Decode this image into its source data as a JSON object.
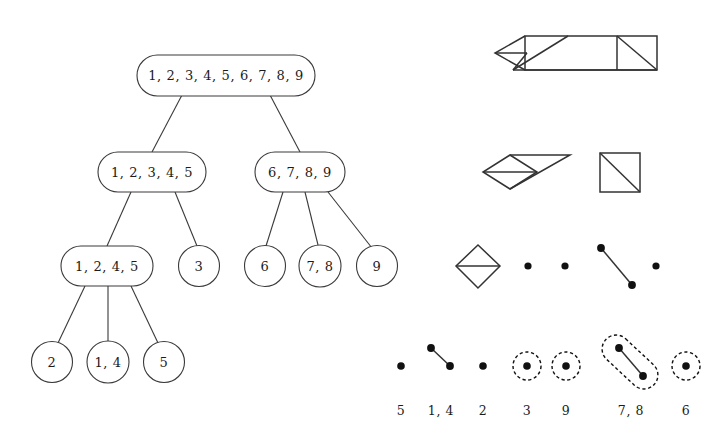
{
  "figure": {
    "background_color": "#ffffff",
    "stroke_color": "#3a3a3a",
    "dot_color": "#111111"
  },
  "tree": {
    "levels": [
      {
        "level": 0,
        "nodes": [
          {
            "id": "root",
            "label": "1, 2, 3, 4, 5, 6, 7, 8, 9",
            "shape": "stadium",
            "cx": 226,
            "cy": 75,
            "w": 178,
            "h": 41
          }
        ]
      },
      {
        "level": 1,
        "nodes": [
          {
            "id": "n-12345",
            "label": "1, 2, 3, 4, 5",
            "shape": "stadium",
            "cx": 152,
            "cy": 172,
            "w": 108,
            "h": 40
          },
          {
            "id": "n-6789",
            "label": "6, 7, 8, 9",
            "shape": "stadium",
            "cx": 300,
            "cy": 172,
            "w": 90,
            "h": 40
          }
        ]
      },
      {
        "level": 2,
        "nodes": [
          {
            "id": "n-1245",
            "label": "1, 2, 4, 5",
            "shape": "stadium",
            "cx": 107,
            "cy": 266,
            "w": 92,
            "h": 40
          },
          {
            "id": "n-3",
            "label": "3",
            "shape": "circle",
            "cx": 199,
            "cy": 266,
            "w": 40,
            "h": 40
          },
          {
            "id": "n-6",
            "label": "6",
            "shape": "circle",
            "cx": 265,
            "cy": 266,
            "w": 40,
            "h": 40
          },
          {
            "id": "n-78",
            "label": "7, 8",
            "shape": "circle",
            "cx": 320,
            "cy": 266,
            "w": 42,
            "h": 42
          },
          {
            "id": "n-9",
            "label": "9",
            "shape": "circle",
            "cx": 377,
            "cy": 266,
            "w": 40,
            "h": 40
          }
        ]
      },
      {
        "level": 3,
        "nodes": [
          {
            "id": "n-2",
            "label": "2",
            "shape": "circle",
            "cx": 52,
            "cy": 362,
            "w": 40,
            "h": 40
          },
          {
            "id": "n-14",
            "label": "1, 4",
            "shape": "circle",
            "cx": 108,
            "cy": 362,
            "w": 42,
            "h": 42
          },
          {
            "id": "n-5",
            "label": "5",
            "shape": "circle",
            "cx": 164,
            "cy": 362,
            "w": 40,
            "h": 40
          }
        ]
      }
    ],
    "edges": [
      {
        "from": "root",
        "to": "n-12345"
      },
      {
        "from": "root",
        "to": "n-6789"
      },
      {
        "from": "n-12345",
        "to": "n-1245"
      },
      {
        "from": "n-12345",
        "to": "n-3"
      },
      {
        "from": "n-6789",
        "to": "n-6"
      },
      {
        "from": "n-6789",
        "to": "n-78"
      },
      {
        "from": "n-6789",
        "to": "n-9"
      },
      {
        "from": "n-1245",
        "to": "n-2"
      },
      {
        "from": "n-1245",
        "to": "n-14"
      },
      {
        "from": "n-1245",
        "to": "n-5"
      }
    ]
  },
  "complex_rows": [
    {
      "row": 0,
      "name": "full-complex-row",
      "description": "Single connected complex: left triangulated diamond merged into a long rectangle with an interior vertical divider and a diagonal in the right square",
      "components": 1
    },
    {
      "row": 1,
      "name": "two-component-row",
      "description": "Left: diamond with horizontal chord attached to a large triangle. Right: square with top-left to bottom-right diagonal",
      "components": 2
    },
    {
      "row": 2,
      "name": "four-component-row",
      "description": "Diamond with horizontal chord, two isolated vertices, one edge, one isolated vertex",
      "components": 5
    },
    {
      "row": 3,
      "name": "atoms-row",
      "description": "Isolated vertex, one edge, three isolated vertices with dashed highlight circles, a dashed stadium around one edge, and one dashed circled vertex",
      "components": 7
    }
  ],
  "bottom_labels": [
    {
      "text": "5",
      "x": 401
    },
    {
      "text": "1, 4",
      "x": 440
    },
    {
      "text": "2",
      "x": 483
    },
    {
      "text": "3",
      "x": 527
    },
    {
      "text": "9",
      "x": 565
    },
    {
      "text": "7, 8",
      "x": 630
    },
    {
      "text": "6",
      "x": 685
    }
  ],
  "legend": {
    "dashed_marker_meaning": "dashed outline marks a newly created component",
    "solid_dot_meaning": "vertex of the simplicial complex"
  }
}
